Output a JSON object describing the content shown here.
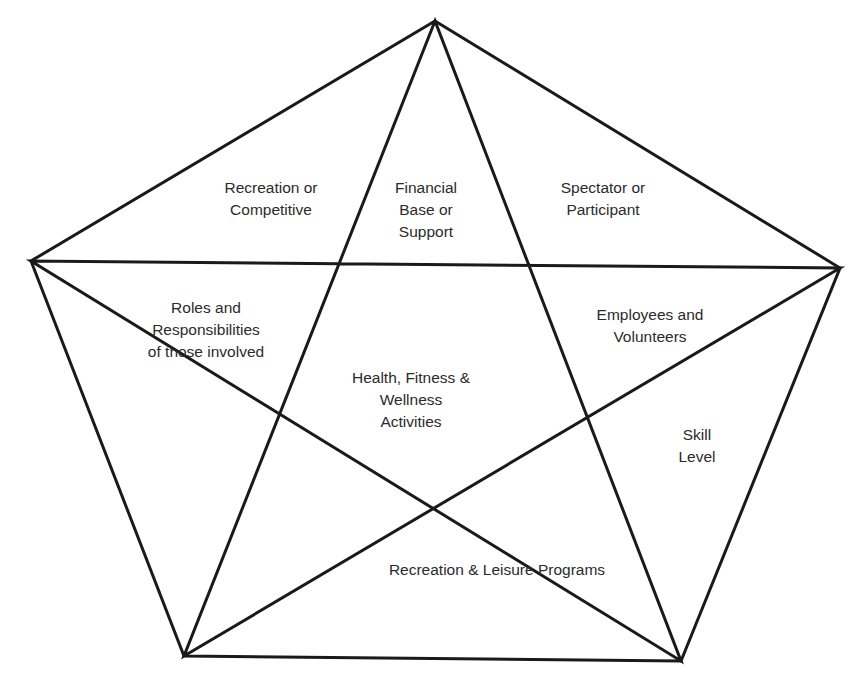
{
  "diagram": {
    "type": "pentagram-in-pentagon",
    "stroke_color": "#1a1a1a",
    "text_color": "#2b2b2b",
    "vertices": {
      "top": [
        435,
        21
      ],
      "left": [
        31,
        261
      ],
      "right": [
        840,
        268
      ],
      "bottom_left": [
        184,
        656
      ],
      "bottom_right": [
        681,
        661
      ]
    },
    "labels": [
      {
        "id": "recreation-or-competitive",
        "lines": [
          "Recreation or",
          "Competitive"
        ],
        "x": 271,
        "y": 177
      },
      {
        "id": "financial-base-or-support",
        "lines": [
          "Financial",
          "Base or",
          "Support"
        ],
        "x": 426,
        "y": 177
      },
      {
        "id": "spectator-or-participant",
        "lines": [
          "Spectator or",
          "Participant"
        ],
        "x": 603,
        "y": 177
      },
      {
        "id": "roles-and-responsibilities",
        "lines": [
          "Roles and",
          "Responsibilities",
          "of those involved"
        ],
        "x": 206,
        "y": 297
      },
      {
        "id": "employees-and-volunteers",
        "lines": [
          "Employees and",
          "Volunteers"
        ],
        "x": 650,
        "y": 304
      },
      {
        "id": "health-fitness-wellness",
        "lines": [
          "Health, Fitness &",
          "Wellness",
          "Activities"
        ],
        "x": 411,
        "y": 367
      },
      {
        "id": "skill-level",
        "lines": [
          "Skill",
          "Level"
        ],
        "x": 697,
        "y": 424
      },
      {
        "id": "recreation-leisure-programs",
        "lines": [
          "Recreation & Leisure Programs"
        ],
        "x": 497,
        "y": 559
      }
    ]
  }
}
